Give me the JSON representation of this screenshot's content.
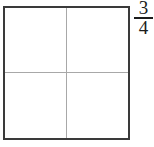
{
  "figure": {
    "name": "fraction-area-model",
    "shape": {
      "type": "square",
      "total_parts": 4,
      "shaded_parts": 0,
      "partition": "quartered-by-cross",
      "border_color": "#3a3a3a",
      "divider_color": "#a8a8a8",
      "fill_color": "#ffffff",
      "parts": [
        {
          "id": "top-left",
          "shaded": false
        },
        {
          "id": "top-right",
          "shaded": false
        },
        {
          "id": "bottom-left",
          "shaded": false
        },
        {
          "id": "bottom-right",
          "shaded": false
        }
      ]
    },
    "fraction": {
      "numerator": "3",
      "denominator": "4",
      "text": "3/4",
      "color": "#1c1c1c"
    }
  }
}
